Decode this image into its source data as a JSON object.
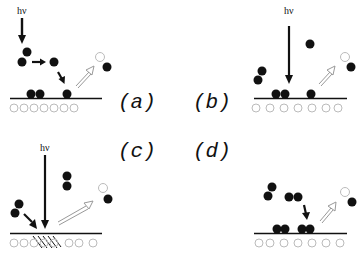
{
  "figure": {
    "colors": {
      "atom": "#111111",
      "substrate": "#bbbbbb",
      "open_arrow": "#999999",
      "line": "#111111"
    },
    "photon_label": "hν",
    "panels": [
      {
        "id": "a",
        "label": "(a)",
        "photon": true,
        "process": "gas-phase photodissociation, adsorption"
      },
      {
        "id": "b",
        "label": "(b)",
        "photon": true,
        "process": "direct photoexcitation of adsorbate"
      },
      {
        "id": "c",
        "label": "(c)",
        "photon": true,
        "process": "substrate-mediated excitation (hatched region)"
      },
      {
        "id": "d",
        "label": "(d)",
        "photon": false,
        "process": "thermal / non-photon reaction"
      }
    ]
  }
}
